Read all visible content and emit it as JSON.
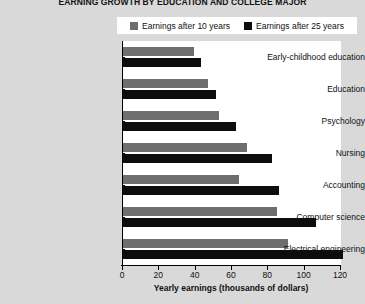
{
  "chart_data": {
    "type": "bar",
    "orientation": "horizontal",
    "title": "EARNING GROWTH BY EDUCATION AND COLLEGE MAJOR",
    "xlabel": "Yearly earnings (thousands of dollars)",
    "ylabel": "",
    "xlim": [
      0,
      120
    ],
    "xticks": [
      0,
      20,
      40,
      60,
      80,
      100,
      120
    ],
    "grid": false,
    "legend_position": "top",
    "categories": [
      "Early-childhood education",
      "Education",
      "Psychology",
      "Nursing",
      "Accounting",
      "Computer science",
      "Electrical engineering"
    ],
    "series": [
      {
        "name": "Earnings after 10 years",
        "color": "#6e6e6e",
        "values": [
          39,
          47,
          53,
          68,
          64,
          85,
          91
        ]
      },
      {
        "name": "Earnings after 25 years",
        "color": "#0d0d0d",
        "values": [
          43,
          51,
          62,
          82,
          86,
          106,
          121
        ]
      }
    ]
  },
  "legend": {
    "entries": [
      {
        "label": "Earnings after 10 years",
        "color": "#6e6e6e",
        "swatch": "gray-square-icon"
      },
      {
        "label": "Earnings after 25 years",
        "color": "#0d0d0d",
        "swatch": "black-square-icon"
      }
    ]
  },
  "colors": {
    "page_background": "#d9d9d9",
    "plot_background": "#ffffff",
    "axis": "#000000",
    "series_10_years": "#6e6e6e",
    "series_25_years": "#0d0d0d"
  }
}
